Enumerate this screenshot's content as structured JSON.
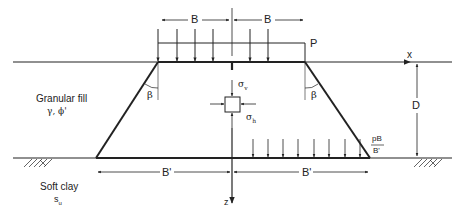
{
  "diagram": {
    "labels": {
      "B_left": "B",
      "B_right": "B",
      "P": "P",
      "x_axis": "x",
      "z_axis": "z",
      "D": "D",
      "beta_left": "β",
      "beta_right": "β",
      "sigma_v": "σ",
      "sigma_v_sub": "v",
      "sigma_h": "σ",
      "sigma_h_sub": "h",
      "Bprime_left": "B'",
      "Bprime_right": "B'",
      "pB_num": "pB",
      "pB_den": "B'",
      "fill_name": "Granular fill",
      "fill_params": "γ, ϕ'",
      "clay_name": "Soft clay",
      "clay_param": "s",
      "clay_param_sub": "u"
    },
    "colors": {
      "line": "#222222",
      "background": "#ffffff"
    }
  }
}
